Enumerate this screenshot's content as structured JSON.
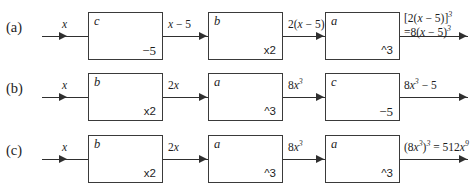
{
  "diagram": {
    "line_color": "#2f2f2f",
    "box_border_color": "#3a3a3a",
    "background": "#ffffff",
    "rows": [
      {
        "id": "a",
        "label": "(a)",
        "input_label": "x",
        "boxes": [
          {
            "letter": "c",
            "operation": "−5"
          },
          {
            "letter": "b",
            "operation": "x2"
          },
          {
            "letter": "a",
            "operation": "^3"
          }
        ],
        "connector_labels": [
          "x − 5",
          "2(x − 5)"
        ],
        "output_label_line1": "[2(x − 5)]³",
        "output_label_line2": "=8(x − 5)³"
      },
      {
        "id": "b",
        "label": "(b)",
        "input_label": "x",
        "boxes": [
          {
            "letter": "b",
            "operation": "x2"
          },
          {
            "letter": "a",
            "operation": "^3"
          },
          {
            "letter": "c",
            "operation": "−5"
          }
        ],
        "connector_labels": [
          "2x",
          "8x³"
        ],
        "output_label_line1": "8x³ − 5",
        "output_label_line2": ""
      },
      {
        "id": "c",
        "label": "(c)",
        "input_label": "x",
        "boxes": [
          {
            "letter": "b",
            "operation": "x2"
          },
          {
            "letter": "a",
            "operation": "^3"
          },
          {
            "letter": "a",
            "operation": "^3"
          }
        ],
        "connector_labels": [
          "2x",
          "8x³"
        ],
        "output_label_line1": "(8x³)³ = 512x⁹",
        "output_label_line2": ""
      }
    ]
  }
}
